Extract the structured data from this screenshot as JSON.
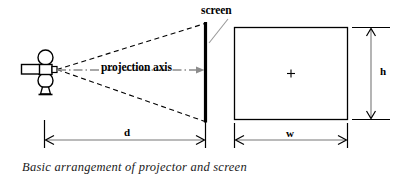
{
  "figure": {
    "caption": "Basic arrangement of projector and screen",
    "labels": {
      "screen": "screen",
      "projection_axis": "projection axis",
      "distance": "d",
      "width": "w",
      "height": "h"
    },
    "colors": {
      "line": "#000000",
      "axis": "#888888",
      "dimension": "#555555",
      "caption_text": "#1a1a1a",
      "background": "#ffffff"
    },
    "elements": {
      "projector": "projector-icon",
      "screen_line": "screen-line",
      "projected_rectangle": "projected-image-rect",
      "center_mark": "+",
      "cone_upper": "projection-cone-upper",
      "cone_lower": "projection-cone-lower"
    }
  }
}
